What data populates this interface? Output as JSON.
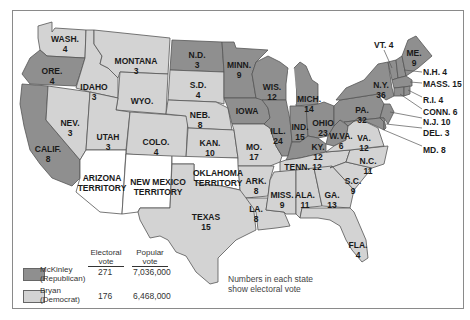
{
  "map": {
    "title": "Election of 1896",
    "note_line1": "Numbers in each state",
    "note_line2": "show electoral vote",
    "colors": {
      "republican": "#8f8f8f",
      "democrat": "#d3d3d3",
      "territory": "#ffffff",
      "border": "#555555"
    }
  },
  "legend": {
    "header_electoral_1": "Electoral",
    "header_electoral_2": "vote",
    "header_popular_1": "Popular",
    "header_popular_2": "vote",
    "candidates": [
      {
        "name": "McKinley",
        "party": "(Republican)",
        "electoral": "271",
        "popular": "7,036,000",
        "color": "#8f8f8f"
      },
      {
        "name": "Bryan",
        "party": "(Democrat)",
        "electoral": "176",
        "popular": "6,468,000",
        "color": "#d3d3d3"
      }
    ]
  },
  "states": {
    "wash": {
      "name": "WASH.",
      "votes": "4",
      "party": "D"
    },
    "ore": {
      "name": "ORE.",
      "votes": "4",
      "party": "R"
    },
    "calif": {
      "name": "CALIF.",
      "votes": "8",
      "party": "R"
    },
    "idaho": {
      "name": "IDAHO",
      "votes": "3",
      "party": "D"
    },
    "nev": {
      "name": "NEV.",
      "votes": "3",
      "party": "D"
    },
    "montana": {
      "name": "MONTANA",
      "votes": "3",
      "party": "D"
    },
    "wyo": {
      "name": "WYO.",
      "votes": "",
      "party": "D"
    },
    "utah": {
      "name": "UTAH",
      "votes": "3",
      "party": "D"
    },
    "colo": {
      "name": "COLO.",
      "votes": "4",
      "party": "D"
    },
    "arizona": {
      "name1": "ARIZONA",
      "name2": "TERRITORY"
    },
    "newmexico": {
      "name1": "NEW MEXICO",
      "name2": "TERRITORY"
    },
    "oklahoma": {
      "name1": "OKLAHOMA",
      "name2": "TERRITORY"
    },
    "nd": {
      "name": "N.D.",
      "votes": "3",
      "party": "R"
    },
    "sd": {
      "name": "S.D.",
      "votes": "4",
      "party": "D"
    },
    "neb": {
      "name": "NEB.",
      "votes": "8",
      "party": "D"
    },
    "kan": {
      "name": "KAN.",
      "votes": "10",
      "party": "D"
    },
    "texas": {
      "name": "TEXAS",
      "votes": "15",
      "party": "D"
    },
    "minn": {
      "name": "MINN.",
      "votes": "9",
      "party": "R"
    },
    "iowa": {
      "name": "IOWA",
      "votes": "",
      "party": "R"
    },
    "mo": {
      "name": "MO.",
      "votes": "17",
      "party": "D"
    },
    "ark": {
      "name": "ARK.",
      "votes": "8",
      "party": "D"
    },
    "la": {
      "name": "LA.",
      "votes": "8",
      "party": "D"
    },
    "wis": {
      "name": "WIS.",
      "votes": "12",
      "party": "R"
    },
    "ill": {
      "name": "ILL.",
      "votes": "24",
      "party": "R"
    },
    "mich": {
      "name": "MICH.",
      "votes": "14",
      "party": "R"
    },
    "ind": {
      "name": "IND.",
      "votes": "15",
      "party": "R"
    },
    "ohio": {
      "name": "OHIO",
      "votes": "23",
      "party": "R"
    },
    "ky": {
      "name": "KY.",
      "votes": "12",
      "party": "R"
    },
    "tenn": {
      "name": "TENN. 12",
      "party": "D"
    },
    "miss": {
      "name": "MISS.",
      "votes": "9",
      "party": "D"
    },
    "ala": {
      "name": "ALA.",
      "votes": "11",
      "party": "D"
    },
    "ga": {
      "name": "GA.",
      "votes": "13",
      "party": "D"
    },
    "fla": {
      "name": "FLA.",
      "votes": "4",
      "party": "D"
    },
    "sc": {
      "name": "S.C.",
      "votes": "9",
      "party": "D"
    },
    "nc": {
      "name": "N.C.",
      "votes": "11",
      "party": "D"
    },
    "va": {
      "name": "VA.",
      "votes": "12",
      "party": "D"
    },
    "wva": {
      "name": "W.VA.",
      "votes": "6",
      "party": "R"
    },
    "pa": {
      "name": "PA.",
      "votes": "32",
      "party": "R"
    },
    "ny": {
      "name": "N.Y.",
      "votes": "36",
      "party": "R"
    },
    "vt": {
      "name": "VT. 4",
      "party": "R"
    },
    "me": {
      "name": "ME.",
      "votes": "9",
      "party": "R"
    },
    "nh": {
      "name": "N.H. 4",
      "party": "R"
    },
    "mass": {
      "name": "MASS. 15",
      "party": "R"
    },
    "ri": {
      "name": "R.I. 4",
      "party": "R"
    },
    "conn": {
      "name": "CONN. 6",
      "party": "R"
    },
    "nj": {
      "name": "N.J. 10",
      "party": "R"
    },
    "del": {
      "name": "DEL. 3",
      "party": "R"
    },
    "md": {
      "name": "MD. 8",
      "party": "R"
    }
  }
}
